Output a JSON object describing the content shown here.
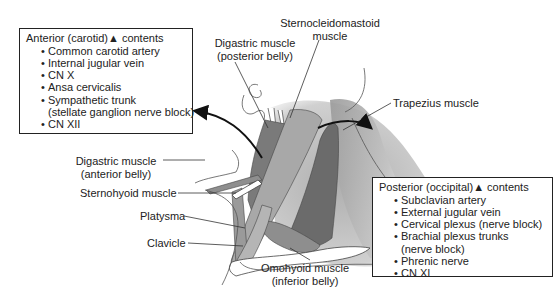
{
  "anterior_box": {
    "title": "Anterior (carotid)",
    "triangle_symbol": "▲",
    "title_suffix": "contents",
    "items": [
      {
        "text": "Common carotid artery"
      },
      {
        "text": "Internal jugular vein"
      },
      {
        "text": "CN X"
      },
      {
        "text": "Ansa cervicalis"
      },
      {
        "text": "Sympathetic trunk",
        "continuation": "(stellate ganglion nerve block)"
      },
      {
        "text": "CN XII"
      }
    ]
  },
  "posterior_box": {
    "title": "Posterior (occipital)",
    "triangle_symbol": "▲",
    "title_suffix": "contents",
    "items": [
      {
        "text": "Subclavian artery"
      },
      {
        "text": "External jugular vein"
      },
      {
        "text": "Cervical plexus (nerve block)"
      },
      {
        "text": "Brachial plexus trunks",
        "continuation": "(nerve block)"
      },
      {
        "text": "Phrenic nerve"
      },
      {
        "text": "CN XI"
      }
    ]
  },
  "labels": {
    "scm_line1": "Sternocleidomastoid",
    "scm_line2": "muscle",
    "digastric_post_line1": "Digastric muscle",
    "digastric_post_line2": "(posterior belly)",
    "trapezius": "Trapezius muscle",
    "digastric_ant_line1": "Digastric muscle",
    "digastric_ant_line2": "(anterior belly)",
    "sternohyoid": "Sternohyoid muscle",
    "platysma": "Platysma",
    "clavicle": "Clavicle",
    "omohyoid_line1": "Omohyoid muscle",
    "omohyoid_line2": "(inferior belly)"
  },
  "colors": {
    "muscle_light": "#a9a9a9",
    "muscle_mid": "#8c8c8c",
    "muscle_dark": "#6e6e6e",
    "outline": "#333333"
  }
}
